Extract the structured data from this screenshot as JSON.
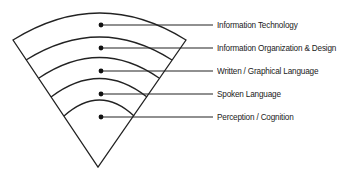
{
  "diagram": {
    "shape": "fan / wedge of nested arcs",
    "stroke_color": "#222222",
    "background_color": "#ffffff",
    "layers": [
      {
        "label": "Information Technology"
      },
      {
        "label": "Information Organization & Design"
      },
      {
        "label": "Written / Graphical Language"
      },
      {
        "label": "Spoken Language"
      },
      {
        "label": "Perception / Cognition"
      }
    ]
  }
}
